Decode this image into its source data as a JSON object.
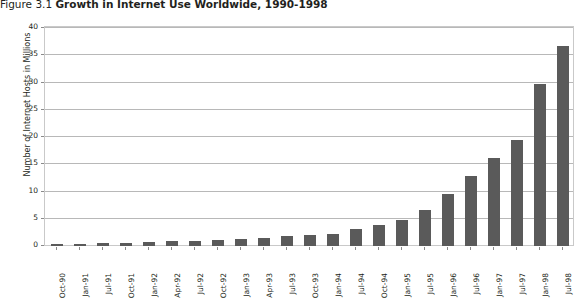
{
  "title": {
    "figure_number": "Figure 3.1",
    "caption": "Growth in Internet Use Worldwide, 1990-1998"
  },
  "chart_data": {
    "type": "bar",
    "title": "Growth in Internet Use Worldwide, 1990-1998",
    "xlabel": "",
    "ylabel": "Number of Internet Hosts in Millions",
    "ylim": [
      0,
      40
    ],
    "ytick_step": 5,
    "yticks": [
      "0",
      "5",
      "10",
      "15",
      "20",
      "25",
      "30",
      "35",
      "40"
    ],
    "grid": "horizontal",
    "legend": "none",
    "bar_color": "#5a5a5a",
    "categories": [
      "Oct-90",
      "Jan-91",
      "Jul-91",
      "Oct-91",
      "Jan-92",
      "Apr-92",
      "Jul-92",
      "Oct-92",
      "Jan-93",
      "Apr-93",
      "Jul-93",
      "Oct-93",
      "Jan-94",
      "Jul-94",
      "Oct-94",
      "Jan-95",
      "Jul-95",
      "Jan-96",
      "Jul-96",
      "Jan-97",
      "Jul-97",
      "Jan-98",
      "Jul-98"
    ],
    "values": [
      0.31,
      0.38,
      0.54,
      0.62,
      0.73,
      0.89,
      0.99,
      1.14,
      1.31,
      1.49,
      1.78,
      2.06,
      2.22,
      3.21,
      3.86,
      4.85,
      6.64,
      9.47,
      12.88,
      16.15,
      19.54,
      29.67,
      36.74
    ],
    "value_labels_visible": false
  }
}
